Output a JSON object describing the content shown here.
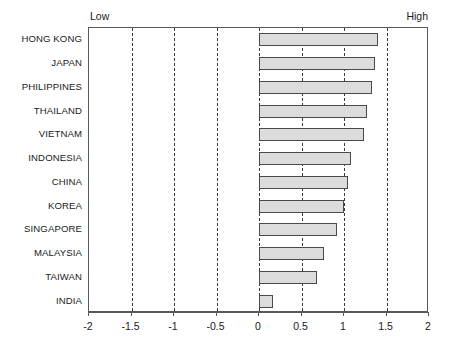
{
  "chart_data": {
    "type": "bar",
    "orientation": "horizontal",
    "title": "",
    "subtitle": "",
    "xlabel": "",
    "ylabel": "",
    "xlim": [
      -2,
      2
    ],
    "xticks": [
      -2,
      -1.5,
      -1,
      -0.5,
      0,
      0.5,
      1,
      1.5,
      2
    ],
    "xtick_labels": [
      "-2",
      "-1.5",
      "-1",
      "-0.5",
      "0",
      "0.5",
      "1",
      "1.5",
      "2"
    ],
    "grid": true,
    "grid_axis": "x",
    "grid_style": "dashed",
    "legend": false,
    "axis_anchor_labels": {
      "low": "Low",
      "high": "High"
    },
    "categories": [
      "HONG KONG",
      "JAPAN",
      "PHILIPPINES",
      "THAILAND",
      "VIETNAM",
      "INDONESIA",
      "CHINA",
      "KOREA",
      "SINGAPORE",
      "MALAYSIA",
      "TAIWAN",
      "INDIA"
    ],
    "values": [
      1.4,
      1.36,
      1.33,
      1.27,
      1.24,
      1.08,
      1.05,
      1.0,
      0.92,
      0.76,
      0.68,
      0.16
    ],
    "colors": {
      "bar_fill": "#dcdcdc",
      "bar_stroke": "#4a4a4a",
      "grid": "#3a3a3a",
      "frame": "#55595c",
      "text": "#1a1a1a",
      "background": "#ffffff"
    }
  }
}
